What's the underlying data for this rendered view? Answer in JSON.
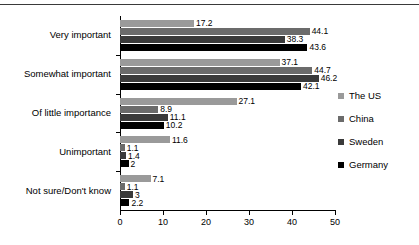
{
  "chart_data": {
    "type": "bar",
    "orientation": "horizontal",
    "title": "",
    "subtitle": "",
    "xlabel": "",
    "ylabel": "",
    "xlim": [
      0,
      50
    ],
    "xticks": [
      0,
      10,
      20,
      30,
      40,
      50
    ],
    "grid": false,
    "legend_position": "right",
    "categories": [
      "Very important",
      "Somewhat important",
      "Of little importance",
      "Unimportant",
      "Not sure/Don't know"
    ],
    "series": [
      {
        "name": "The US",
        "color": "#9a9a9a",
        "values": [
          17.2,
          37.1,
          27.1,
          11.6,
          7.1
        ],
        "labels": [
          "17.2",
          "37.1",
          "27.1",
          "11.6",
          "7.1"
        ]
      },
      {
        "name": "China",
        "color": "#6b6b6b",
        "values": [
          44.1,
          44.7,
          8.9,
          1.1,
          1.1
        ],
        "labels": [
          "44.1",
          "44.7",
          "8.9",
          "1.1",
          "1.1"
        ]
      },
      {
        "name": "Sweden",
        "color": "#3a3a3a",
        "values": [
          38.3,
          46.2,
          11.1,
          1.4,
          3
        ],
        "labels": [
          "38.3",
          "46.2",
          "11.1",
          "1.4",
          "3"
        ]
      },
      {
        "name": "Germany",
        "color": "#000000",
        "values": [
          43.6,
          42.1,
          10.2,
          2,
          2.2
        ],
        "labels": [
          "43.6",
          "42.1",
          "10.2",
          "2",
          "2.2"
        ]
      }
    ]
  }
}
